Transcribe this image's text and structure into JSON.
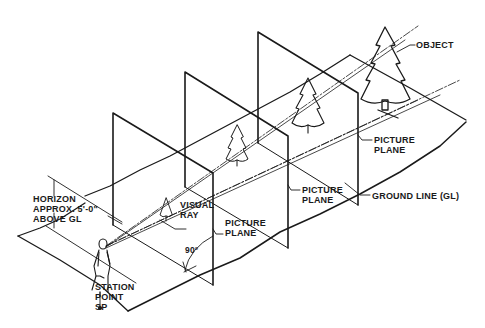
{
  "figure": {
    "type": "perspective picture-plane diagram",
    "colors": {
      "ink": "#1a1a1a",
      "background": "#ffffff"
    }
  },
  "labels": {
    "object": "OBJECT",
    "picture_plane_far": [
      "PICTURE",
      "PLANE"
    ],
    "picture_plane_middle": [
      "PICTURE",
      "PLANE"
    ],
    "picture_plane_near": [
      "PICTURE",
      "PLANE"
    ],
    "ground_line": "GROUND LINE (GL)",
    "visual_ray": [
      "VISUAL",
      "RAY"
    ],
    "horizon": [
      "HORIZON",
      "APPROX. 5'-0\"",
      "ABOVE GL"
    ],
    "station_point": [
      "STATION",
      "POINT",
      "SP"
    ],
    "angle": "90°"
  }
}
